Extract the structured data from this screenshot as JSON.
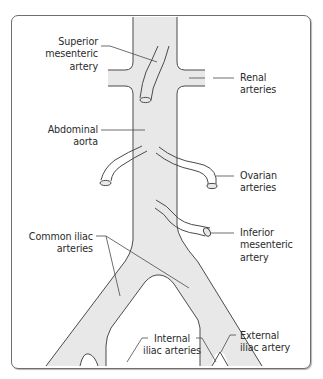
{
  "diagram": {
    "type": "anatomical-line-drawing",
    "colors": {
      "vessel_fill": "#e8e8e8",
      "vessel_stroke": "#4a4a4a",
      "leader_line": "#4a4a4a",
      "frame_border": "#6e6e6e",
      "text": "#2b2b2b",
      "background": "#ffffff"
    },
    "labels": {
      "superior_mesenteric": "Superior\nmesenteric\nartery",
      "renal": "Renal\narteries",
      "abdominal_aorta": "Abdominal\naorta",
      "ovarian": "Ovarian\narteries",
      "inferior_mesenteric": "Inferior\nmesenteric\nartery",
      "common_iliac": "Common iliac\narteries",
      "internal_iliac": "Internal\niliac arteries",
      "external_iliac": "External\niliac artery"
    }
  }
}
